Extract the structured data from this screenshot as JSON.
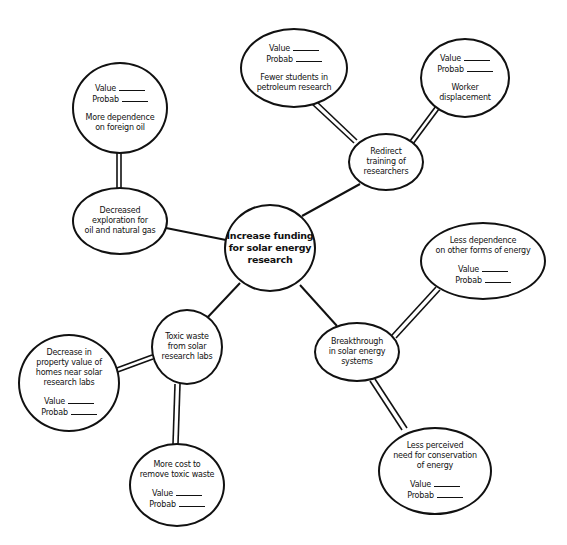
{
  "diagram": {
    "type": "consequence-tree",
    "center": {
      "id": "center",
      "label": "Increase funding\nfor solar energy\nresearch"
    },
    "nodes": [
      {
        "id": "exploration",
        "label": "Decreased\nexploration for\noil and natural gas",
        "has_rating": false
      },
      {
        "id": "foreign_oil",
        "label": "More dependence\non foreign oil",
        "has_rating": true,
        "rating_position": "top"
      },
      {
        "id": "redirect",
        "label": "Redirect\ntraining of\nresearchers",
        "has_rating": false
      },
      {
        "id": "fewer_students",
        "label": "Fewer students in\npetroleum research",
        "has_rating": true,
        "rating_position": "top"
      },
      {
        "id": "worker",
        "label": "Worker\ndisplacement",
        "has_rating": true,
        "rating_position": "top"
      },
      {
        "id": "toxic",
        "label": "Toxic waste\nfrom solar\nresearch labs",
        "has_rating": false
      },
      {
        "id": "property",
        "label": "Decrease in\nproperty value of\nhomes near solar\nresearch labs",
        "has_rating": true,
        "rating_position": "bottom"
      },
      {
        "id": "cost",
        "label": "More cost to\nremove toxic waste",
        "has_rating": true,
        "rating_position": "bottom"
      },
      {
        "id": "breakthrough",
        "label": "Breakthrough\nin solar energy\nsystems",
        "has_rating": false
      },
      {
        "id": "less_dependence",
        "label": "Less dependence\non other forms of energy",
        "has_rating": true,
        "rating_position": "bottom"
      },
      {
        "id": "less_conservation",
        "label": "Less perceived\nneed for conservation\nof energy",
        "has_rating": true,
        "rating_position": "bottom"
      }
    ],
    "rating_labels": {
      "value": "Value",
      "probab": "Probab"
    },
    "edges": [
      {
        "from": "center",
        "to": "exploration",
        "style": "single"
      },
      {
        "from": "center",
        "to": "redirect",
        "style": "single"
      },
      {
        "from": "center",
        "to": "toxic",
        "style": "single"
      },
      {
        "from": "center",
        "to": "breakthrough",
        "style": "single"
      },
      {
        "from": "exploration",
        "to": "foreign_oil",
        "style": "double"
      },
      {
        "from": "redirect",
        "to": "fewer_students",
        "style": "double"
      },
      {
        "from": "redirect",
        "to": "worker",
        "style": "double"
      },
      {
        "from": "toxic",
        "to": "property",
        "style": "double"
      },
      {
        "from": "toxic",
        "to": "cost",
        "style": "double"
      },
      {
        "from": "breakthrough",
        "to": "less_dependence",
        "style": "double"
      },
      {
        "from": "breakthrough",
        "to": "less_conservation",
        "style": "double"
      }
    ]
  }
}
